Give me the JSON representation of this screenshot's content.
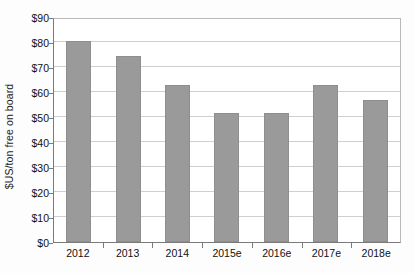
{
  "chart_data": {
    "type": "bar",
    "title": "",
    "subtitle": "",
    "xlabel": "",
    "ylabel": "$US/ton free on board",
    "categories": [
      "2012",
      "2013",
      "2014",
      "2015e",
      "2016e",
      "2017e",
      "2018e"
    ],
    "values": [
      80.5,
      74.5,
      62.8,
      51.8,
      51.8,
      62.8,
      57.0
    ],
    "series": [
      {
        "name": "Price",
        "values": [
          80.5,
          74.5,
          62.8,
          51.8,
          51.8,
          62.8,
          57.0
        ]
      }
    ],
    "ylim": [
      0,
      90
    ],
    "ytick_values": [
      0,
      10,
      20,
      30,
      40,
      50,
      60,
      70,
      80,
      90
    ],
    "ytick_labels": [
      "$0",
      "$10",
      "$20",
      "$30",
      "$40",
      "$50",
      "$60",
      "$70",
      "$80",
      "$90"
    ],
    "grid": true,
    "grid_axis": "y",
    "legend": false,
    "legend_position": "none",
    "bar_color": "#9a9a9a",
    "grid_color": "#cfcfcf",
    "axis_color": "#7a7a7a",
    "background_color": "#ffffff",
    "text_color": "#111111",
    "annotations": []
  }
}
